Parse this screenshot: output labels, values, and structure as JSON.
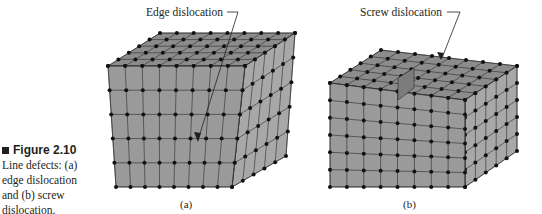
{
  "figure": {
    "number": "Figure 2.10",
    "caption_lines": [
      "Line defects: (a)",
      "edge dislocation",
      "and (b) screw",
      "dislocation."
    ]
  },
  "panels": [
    {
      "id": "a",
      "sublabel": "(a)",
      "callout": "Edge dislocation"
    },
    {
      "id": "b",
      "sublabel": "(b)",
      "callout": "Screw dislocation"
    }
  ],
  "colors": {
    "face_front": "#9a9a9a",
    "face_top": "#8c8c8c",
    "face_side": "#a8a8a8",
    "line": "#2a2a2a",
    "atom": "#111111"
  }
}
